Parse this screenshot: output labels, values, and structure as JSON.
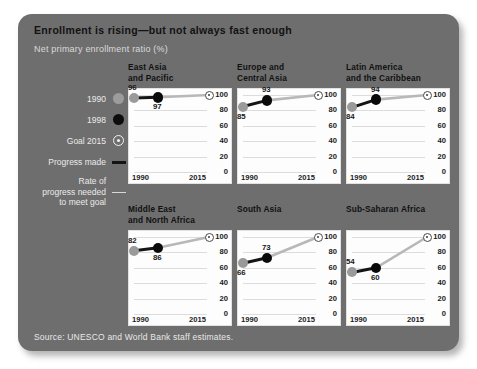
{
  "figure": {
    "title": "Enrollment is rising—but not always fast enough",
    "subtitle": "Net primary enrollment ratio (%)",
    "source": "Source: UNESCO and World Bank staff estimates."
  },
  "legend": {
    "items": [
      {
        "label": "1990",
        "marker": "gray-filled-circle-icon"
      },
      {
        "label": "1998",
        "marker": "black-filled-circle-icon"
      },
      {
        "label": "Goal 2015",
        "marker": "target-circle-icon"
      },
      {
        "label": "Progress made",
        "marker": "thick-dark-line-icon"
      },
      {
        "label": "Rate of\nprogress needed\nto meet goal",
        "marker": "thin-light-line-icon"
      }
    ],
    "rate_label_line1": "Rate of",
    "rate_label_line2": "progress needed",
    "rate_label_line3": "to meet goal"
  },
  "chart_data": {
    "type": "line",
    "title": "Enrollment is rising—but not always fast enough",
    "subtitle": "Net primary enrollment ratio (%)",
    "ylabel": "Net primary enrollment ratio (%)",
    "xlabel": "",
    "ylim": [
      0,
      100
    ],
    "yticks": [
      100,
      80,
      60,
      40,
      20,
      0
    ],
    "xticks": [
      "1990",
      "2015"
    ],
    "x": [
      1990,
      1998,
      2015
    ],
    "grid": true,
    "legend_position": "left",
    "series_names": [
      "1990",
      "1998",
      "Goal 2015"
    ],
    "panels": [
      {
        "name": "East Asia and Pacific",
        "title_line1": "East Asia",
        "title_line2": "and Pacific",
        "v1990": 96,
        "v1998": 97,
        "goal2015": 100,
        "label1990_pos": "above",
        "label1998_pos": "below"
      },
      {
        "name": "Europe and Central Asia",
        "title_line1": "Europe and",
        "title_line2": "Central Asia",
        "v1990": 85,
        "v1998": 93,
        "goal2015": 100,
        "label1990_pos": "below",
        "label1998_pos": "above"
      },
      {
        "name": "Latin America and the Caribbean",
        "title_line1": "Latin America",
        "title_line2": "and the Caribbean",
        "v1990": 84,
        "v1998": 94,
        "goal2015": 100,
        "label1990_pos": "below",
        "label1998_pos": "above"
      },
      {
        "name": "Middle East and North Africa",
        "title_line1": "Middle East",
        "title_line2": "and North Africa",
        "v1990": 82,
        "v1998": 86,
        "goal2015": 100,
        "label1990_pos": "above",
        "label1998_pos": "below"
      },
      {
        "name": "South Asia",
        "title_line1": "South Asia",
        "title_line2": "",
        "v1990": 66,
        "v1998": 73,
        "goal2015": 100,
        "label1990_pos": "below",
        "label1998_pos": "above"
      },
      {
        "name": "Sub-Saharan Africa",
        "title_line1": "Sub-Saharan Africa",
        "title_line2": "",
        "v1990": 54,
        "v1998": 60,
        "goal2015": 100,
        "label1990_pos": "above",
        "label1998_pos": "below"
      }
    ]
  },
  "colors": {
    "card_background": "#6e6e6e",
    "panel_background": "#fdfdfd",
    "marker_1990": "#9a9a9a",
    "marker_1998": "#0a0a0a",
    "goal_marker": "#3a3a3a",
    "progress_line": "#141414",
    "needed_line": "#b8b8b8",
    "title_text": "#121212",
    "subtitle_text": "#d9d9d9"
  }
}
